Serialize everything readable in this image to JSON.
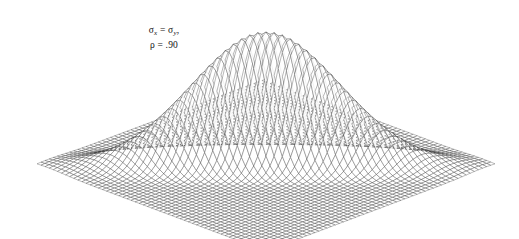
{
  "figure": {
    "title": "",
    "background_color": "#ffffff",
    "width": 519,
    "height": 239,
    "annotation": {
      "line1_sigma_x": "σ",
      "line1_sub_x": "x",
      "line1_equals": " = ",
      "line1_sigma_y": "σ",
      "line1_sub_y": "y",
      "line1_comma": ",",
      "line2_rho": "ρ",
      "line2_equals": " = ",
      "line2_value": ".90",
      "plain_text_line1": "σx = σy,",
      "plain_text_line2": "ρ = .90"
    }
  },
  "chart_data": {
    "type": "surface",
    "title": "",
    "subtitle": "",
    "xlabel": "",
    "ylabel": "",
    "zlabel": "",
    "function": "bivariate-normal-density",
    "parameters": {
      "sigma_x": 1.0,
      "sigma_y": 1.0,
      "rho": 0.9,
      "mu_x": 0.0,
      "mu_y": 0.0,
      "sigma_equal": true,
      "correlation_label": ".90"
    },
    "domain": {
      "x_min": -3.0,
      "x_max": 3.0,
      "y_min": -3.0,
      "y_max": 3.0,
      "z_min": 0.0,
      "z_max": 1.0
    },
    "mesh": {
      "u_divisions": 56,
      "v_divisions": 56,
      "line_color": "#2b2b2b",
      "line_width": 0.32,
      "fill_color": "#ffffff",
      "fill_opacity": 0.86
    },
    "projection": {
      "type": "oblique-isometric",
      "center_x": 266,
      "center_y": 165,
      "half_width": 229,
      "half_depth": 43,
      "height_scale": 133,
      "rotation_deg": 45
    },
    "corners": {
      "left": [
        37,
        122
      ],
      "right": [
        495,
        148
      ],
      "front": [
        290,
        208
      ],
      "back": [
        242,
        96
      ]
    },
    "peak": {
      "apex_x": 252,
      "apex_y": 32,
      "description": "narrow elongated ridge along the positive correlation diagonal"
    },
    "grid": true,
    "legend": false,
    "axes_visible": false
  }
}
